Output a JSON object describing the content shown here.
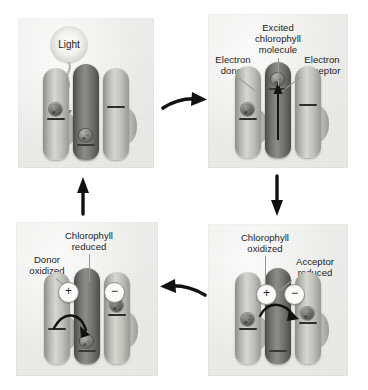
{
  "figure": {
    "panels": [
      {
        "id": "light",
        "position": "top-left",
        "labels": [
          {
            "name": "light",
            "text": "Light"
          }
        ],
        "charges": [],
        "electrons": [
          "donor",
          "chlorophyll"
        ]
      },
      {
        "id": "excited",
        "position": "top-right",
        "labels": [
          {
            "name": "excited-chlorophyll-molecule",
            "text": "Excited\nchlorophyll\nmolecule"
          },
          {
            "name": "electron-donor",
            "text": "Electron\ndonor"
          },
          {
            "name": "electron-acceptor",
            "text": "Electron\nacceptor"
          }
        ],
        "charges": [],
        "electrons": [
          "donor",
          "chlorophyll"
        ]
      },
      {
        "id": "oxidized",
        "position": "bottom-right",
        "labels": [
          {
            "name": "chlorophyll-oxidized",
            "text": "Chlorophyll\noxidized"
          },
          {
            "name": "acceptor-reduced",
            "text": "Acceptor\nreduced"
          }
        ],
        "charges": [
          {
            "name": "chlorophyll-positive-charge",
            "symbol": "+"
          },
          {
            "name": "acceptor-negative-charge",
            "symbol": "−"
          }
        ],
        "electrons": [
          "donor",
          "acceptor"
        ]
      },
      {
        "id": "reduced",
        "position": "bottom-left",
        "labels": [
          {
            "name": "chlorophyll-reduced",
            "text": "Chlorophyll\nreduced"
          },
          {
            "name": "donor-oxidized",
            "text": "Donor\noxidized"
          }
        ],
        "charges": [
          {
            "name": "donor-positive-charge",
            "symbol": "+"
          },
          {
            "name": "acceptor-negative-charge",
            "symbol": "−"
          }
        ],
        "electrons": [
          "chlorophyll",
          "acceptor"
        ]
      }
    ],
    "electron_symbol": "e",
    "electron_superscript": "−",
    "flow_arrows": [
      {
        "name": "arrow-light-to-excited",
        "direction": "right"
      },
      {
        "name": "arrow-excited-to-oxidized",
        "direction": "down"
      },
      {
        "name": "arrow-oxidized-to-reduced",
        "direction": "left"
      },
      {
        "name": "arrow-reduced-to-light",
        "direction": "up"
      }
    ],
    "colors": {
      "panel_background": "#ecebe8",
      "chlorophyll_column": "#6f6f6b",
      "side_column": "#c2c2bd",
      "arrow": "#000000",
      "leader_line": "#9a9a95",
      "text": "#1b1b1b"
    }
  }
}
